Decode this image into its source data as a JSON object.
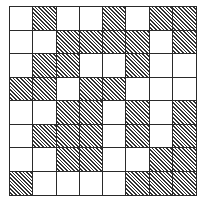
{
  "diagram": {
    "rows": 8,
    "cols": 8,
    "pattern_legend": {
      "1": "hatched",
      "0": "blank"
    },
    "cells": [
      [
        0,
        1,
        0,
        0,
        1,
        0,
        1,
        1
      ],
      [
        0,
        0,
        1,
        1,
        1,
        1,
        0,
        1
      ],
      [
        0,
        1,
        1,
        0,
        0,
        1,
        0,
        0
      ],
      [
        1,
        1,
        0,
        1,
        1,
        0,
        0,
        0
      ],
      [
        0,
        0,
        1,
        1,
        0,
        1,
        0,
        1
      ],
      [
        0,
        1,
        1,
        1,
        0,
        1,
        0,
        1
      ],
      [
        0,
        0,
        1,
        1,
        0,
        0,
        1,
        1
      ],
      [
        1,
        0,
        0,
        0,
        0,
        1,
        1,
        1
      ]
    ],
    "colors": {
      "line": "#2a2a2a",
      "hatch": "#333333",
      "background": "#ffffff"
    }
  }
}
